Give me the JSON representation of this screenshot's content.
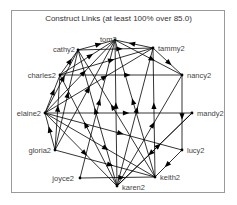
{
  "title": "Construct Links (at least 100% over 85.0)",
  "colors": {
    "edge": "#000000",
    "label": "#444444",
    "frame": "#9a9a9a"
  },
  "nodes": [
    {
      "id": "tom2",
      "label": "tom2",
      "x": 115,
      "y": 40,
      "lx": 100,
      "ly": 42,
      "anchor": "start"
    },
    {
      "id": "cathy2",
      "label": "cathy2",
      "x": 78,
      "y": 50,
      "lx": 75,
      "ly": 52,
      "anchor": "end"
    },
    {
      "id": "tammy2",
      "label": "tammy2",
      "x": 153,
      "y": 48,
      "lx": 158,
      "ly": 51,
      "anchor": "start"
    },
    {
      "id": "charles2",
      "label": "charles2",
      "x": 60,
      "y": 75,
      "lx": 56,
      "ly": 78,
      "anchor": "end"
    },
    {
      "id": "nancy2",
      "label": "nancy2",
      "x": 182,
      "y": 75,
      "lx": 187,
      "ly": 78,
      "anchor": "start"
    },
    {
      "id": "elaine2",
      "label": "elaine2",
      "x": 45,
      "y": 113,
      "lx": 41,
      "ly": 116,
      "anchor": "end"
    },
    {
      "id": "mandy2",
      "label": "mandy2",
      "x": 192,
      "y": 113,
      "lx": 197,
      "ly": 116,
      "anchor": "start"
    },
    {
      "id": "gloria2",
      "label": "gloria2",
      "x": 55,
      "y": 150,
      "lx": 51,
      "ly": 153,
      "anchor": "end"
    },
    {
      "id": "lucy2",
      "label": "lucy2",
      "x": 182,
      "y": 150,
      "lx": 187,
      "ly": 153,
      "anchor": "start"
    },
    {
      "id": "joyce2",
      "label": "joyce2",
      "x": 80,
      "y": 178,
      "lx": 74,
      "ly": 181,
      "anchor": "end"
    },
    {
      "id": "keith2",
      "label": "keith2",
      "x": 155,
      "y": 177,
      "lx": 160,
      "ly": 180,
      "anchor": "start"
    },
    {
      "id": "karen2",
      "label": "karen2",
      "x": 117,
      "y": 186,
      "lx": 122,
      "ly": 190,
      "anchor": "start"
    }
  ],
  "edges": [
    [
      "cathy2",
      "tom2"
    ],
    [
      "tammy2",
      "tom2"
    ],
    [
      "charles2",
      "tom2"
    ],
    [
      "elaine2",
      "tom2"
    ],
    [
      "gloria2",
      "tom2"
    ],
    [
      "karen2",
      "tom2"
    ],
    [
      "keith2",
      "tom2"
    ],
    [
      "tom2",
      "nancy2"
    ],
    [
      "joyce2",
      "tom2"
    ],
    [
      "cathy2",
      "tammy2"
    ],
    [
      "charles2",
      "tammy2"
    ],
    [
      "elaine2",
      "tammy2"
    ],
    [
      "tammy2",
      "nancy2"
    ],
    [
      "karen2",
      "tammy2"
    ],
    [
      "keith2",
      "tammy2"
    ],
    [
      "charles2",
      "cathy2"
    ],
    [
      "elaine2",
      "cathy2"
    ],
    [
      "charles2",
      "nancy2"
    ],
    [
      "elaine2",
      "charles2"
    ],
    [
      "gloria2",
      "charles2"
    ],
    [
      "karen2",
      "charles2"
    ],
    [
      "elaine2",
      "mandy2"
    ],
    [
      "elaine2",
      "keith2"
    ],
    [
      "elaine2",
      "karen2"
    ],
    [
      "elaine2",
      "lucy2"
    ],
    [
      "gloria2",
      "elaine2"
    ],
    [
      "gloria2",
      "keith2"
    ],
    [
      "gloria2",
      "cathy2"
    ],
    [
      "karen2",
      "mandy2"
    ],
    [
      "lucy2",
      "keith2"
    ],
    [
      "nancy2",
      "lucy2"
    ],
    [
      "joyce2",
      "keith2"
    ],
    [
      "karen2",
      "cathy2"
    ],
    [
      "keith2",
      "cathy2"
    ],
    [
      "mandy2",
      "karen2"
    ],
    [
      "karen2",
      "nancy2"
    ]
  ]
}
